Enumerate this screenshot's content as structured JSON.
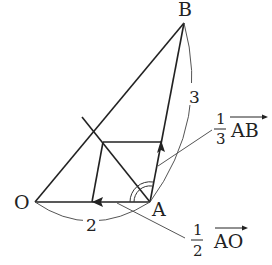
{
  "diagram": {
    "type": "vector-geometry",
    "points": {
      "O": {
        "label": "O",
        "x": 35,
        "y": 202
      },
      "A": {
        "label": "A",
        "x": 150,
        "y": 202
      },
      "B": {
        "label": "B",
        "x": 184,
        "y": 23
      }
    },
    "lengths": {
      "OA": "2",
      "AB": "3"
    },
    "vector_labels": {
      "ab": {
        "coef_num": "1",
        "coef_den": "3",
        "vector": "AB"
      },
      "ao": {
        "coef_num": "1",
        "coef_den": "2",
        "vector": "AO"
      }
    },
    "angle_mark": "double-arc at A (angle bisector)",
    "colors": {
      "line": "#222222",
      "thin_line": "#555555",
      "background": "#ffffff"
    }
  }
}
